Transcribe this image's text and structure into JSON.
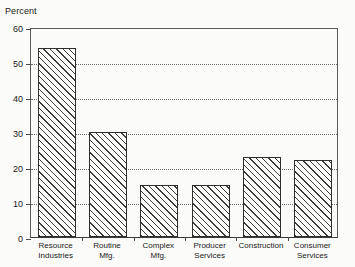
{
  "chart_data": {
    "type": "bar",
    "title": "",
    "ylabel": "Percent",
    "xlabel": "",
    "ylim": [
      0,
      60
    ],
    "yticks": [
      0,
      10,
      20,
      30,
      40,
      50,
      60
    ],
    "gridlines": [
      10,
      20,
      30,
      40,
      50
    ],
    "grid": true,
    "legend": "none",
    "categories": [
      "Resource\nIndustries",
      "Routine\nMfg.",
      "Complex\nMfg.",
      "Producer\nServices",
      "Construction",
      "Consumer\nServices"
    ],
    "values": [
      54,
      30,
      15,
      15,
      23,
      22
    ]
  },
  "axis": {
    "title": "Percent",
    "tick_labels": [
      "60",
      "50",
      "40",
      "30",
      "20",
      "10",
      "0"
    ]
  },
  "colors": {
    "background": "#fbfbf9",
    "frame": "#5a5a5a",
    "bar_outline": "#2e2e2e",
    "hatch": "#3c3c3c",
    "gridline": "#6e6e6e",
    "text": "#1a1a1a"
  }
}
